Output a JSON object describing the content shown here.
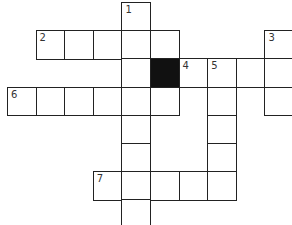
{
  "puzzle": {
    "type": "crossword",
    "grid_origin": {
      "x": 7,
      "y": 2
    },
    "cell_size": {
      "w": 28.6,
      "h": 28.2
    },
    "colors": {
      "line": "#222222",
      "black": "#111111",
      "background": "#ffffff"
    },
    "cells": [
      {
        "row": 0,
        "col": 4,
        "number": "1"
      },
      {
        "row": 1,
        "col": 1,
        "number": "2"
      },
      {
        "row": 1,
        "col": 2
      },
      {
        "row": 1,
        "col": 3
      },
      {
        "row": 1,
        "col": 4
      },
      {
        "row": 1,
        "col": 5
      },
      {
        "row": 1,
        "col": 9,
        "number": "3"
      },
      {
        "row": 2,
        "col": 4
      },
      {
        "row": 2,
        "col": 5,
        "black": true
      },
      {
        "row": 2,
        "col": 6,
        "number": "4"
      },
      {
        "row": 2,
        "col": 7,
        "number": "5"
      },
      {
        "row": 2,
        "col": 8
      },
      {
        "row": 2,
        "col": 9
      },
      {
        "row": 3,
        "col": 0,
        "number": "6"
      },
      {
        "row": 3,
        "col": 1
      },
      {
        "row": 3,
        "col": 2
      },
      {
        "row": 3,
        "col": 3
      },
      {
        "row": 3,
        "col": 4
      },
      {
        "row": 3,
        "col": 5
      },
      {
        "row": 3,
        "col": 7
      },
      {
        "row": 3,
        "col": 9
      },
      {
        "row": 4,
        "col": 4
      },
      {
        "row": 4,
        "col": 7
      },
      {
        "row": 5,
        "col": 4
      },
      {
        "row": 5,
        "col": 7
      },
      {
        "row": 6,
        "col": 3,
        "number": "7"
      },
      {
        "row": 6,
        "col": 4
      },
      {
        "row": 6,
        "col": 5
      },
      {
        "row": 6,
        "col": 6
      },
      {
        "row": 6,
        "col": 7
      },
      {
        "row": 7,
        "col": 4,
        "partial": true
      }
    ],
    "clue_numbers": [
      "1",
      "2",
      "3",
      "4",
      "5",
      "6",
      "7"
    ]
  }
}
